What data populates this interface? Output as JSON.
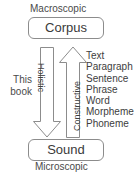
{
  "diagram": {
    "top_scale_label": "Macroscopic",
    "bottom_scale_label": "Microscopic",
    "nodes": {
      "top": "Corpus",
      "bottom": "Sound"
    },
    "arrows": [
      {
        "caption": "Holistic",
        "direction": "down"
      },
      {
        "caption": "Constructive",
        "direction": "up"
      }
    ],
    "annotation": {
      "line1": "This",
      "line2": "book"
    },
    "unit_list": [
      "Text",
      "Paragraph",
      "Sentence",
      "Phrase",
      "Word",
      "Morpheme",
      "Phoneme"
    ],
    "colors": {
      "background": "#ffffff",
      "stroke": "#8c8c8c",
      "text": "#3d3d3d",
      "label_text": "#4a4a4a"
    }
  }
}
